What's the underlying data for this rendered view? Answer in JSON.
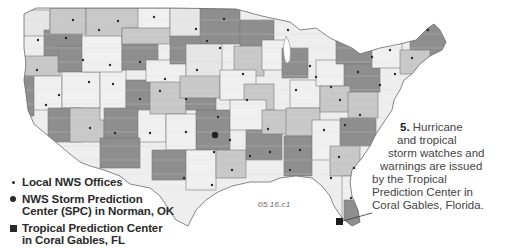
{
  "map": {
    "title": "NWS office regions of the contiguous United States",
    "figure_code": "05.16.c1",
    "colors": {
      "light": "#f0f0f0",
      "mid": "#c8c8c8",
      "dark": "#8e8e8e",
      "border": "#7a7a7a",
      "text": "#2a2a2a"
    },
    "spc_location": "Norman, OK",
    "tpc_location": "Coral Gables, FL"
  },
  "legend": {
    "items": [
      {
        "symbol": "small-dot",
        "label": "Local NWS Offices"
      },
      {
        "symbol": "large-dot",
        "label_line1": "NWS Storm Prediction",
        "label_line2": "Center (SPC) in Norman, OK"
      },
      {
        "symbol": "square",
        "label_line1": "Tropical Prediction Center",
        "label_line2": "in Coral Gables, FL"
      }
    ]
  },
  "callout": {
    "number": "5.",
    "line1_rest": " Hurricane",
    "line2": "and tropical",
    "line3": "storm watches and",
    "line4": "warnings are issued",
    "line5": "by the Tropical",
    "line6": "Prediction Center in",
    "line7": "Coral Gables, Florida."
  }
}
